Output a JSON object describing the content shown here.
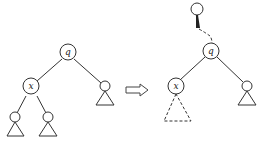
{
  "diagram": {
    "type": "tree-transformation",
    "left_tree": {
      "root": {
        "label": "q"
      },
      "left_child": {
        "label": "x",
        "children": [
          "unlabeled node with subtree",
          "unlabeled node with subtree"
        ]
      },
      "right_child": {
        "label": "",
        "subtree": "triangle"
      }
    },
    "transition_arrow": "double-line right arrow",
    "right_tree": {
      "parent": {
        "label": "",
        "edge_to_q": "dashed with bold start"
      },
      "root": {
        "label": "q"
      },
      "left_child": {
        "label": "x",
        "subtree": "dashed triangle"
      },
      "right_child": {
        "label": "",
        "subtree": "triangle"
      }
    },
    "labels": {
      "left_q": "q",
      "left_x": "x",
      "right_q": "q",
      "right_x": "x"
    }
  }
}
